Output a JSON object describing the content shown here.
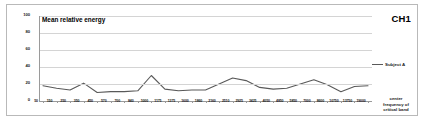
{
  "chart_data": {
    "type": "line",
    "title": "Mean relative energy",
    "xlabel": "center frequency of critical band",
    "ylabel": "",
    "ylim": [
      0,
      100
    ],
    "yticks": [
      0,
      20,
      40,
      60,
      80,
      100
    ],
    "grid": true,
    "legend_position": "right",
    "annotation": "CH1",
    "categories": [
      "50",
      "150",
      "250",
      "350",
      "450",
      "570",
      "700",
      "840",
      "1000",
      "1175",
      "1375",
      "1600",
      "1860",
      "2160",
      "2510",
      "2925",
      "3425",
      "4050",
      "4850",
      "5850",
      "7000",
      "8600",
      "10750",
      "13750",
      "19000"
    ],
    "series": [
      {
        "name": "Subject A",
        "color": "#595959",
        "values": [
          18,
          15,
          13,
          21,
          10,
          11,
          11,
          12,
          30,
          14,
          12,
          13,
          13,
          20,
          27,
          24,
          16,
          14,
          15,
          20,
          25,
          19,
          11,
          17,
          18
        ]
      }
    ]
  },
  "figure": {
    "title": "Mean relative energy",
    "channel_label": "CH1",
    "y_tick_labels": [
      "100",
      "80",
      "60",
      "40",
      "20",
      "0"
    ],
    "x_tick_labels": [
      "50",
      "150",
      "250",
      "350",
      "450",
      "570",
      "700",
      "840",
      "1000",
      "1175",
      "1375",
      "1600",
      "1860",
      "2160",
      "2510",
      "2925",
      "3425",
      "4050",
      "4850",
      "5850",
      "7000",
      "8600",
      "10750",
      "13750",
      "19000"
    ],
    "legend": {
      "label": "Subject A"
    },
    "x_axis_title": {
      "line1": "center",
      "line2": "frequency of",
      "line3": "critical band"
    },
    "colors": {
      "series": "#595959",
      "grid": "#d4d4d4",
      "axis": "#9a9a9a",
      "frame": "#b9b9b9",
      "text": "#1a1a1a"
    }
  }
}
